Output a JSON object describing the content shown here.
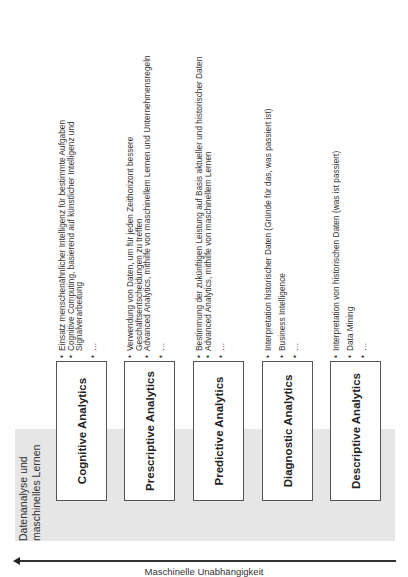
{
  "band": {
    "label_line1": "Datenanalyse und",
    "label_line2": "maschinelles Lernen",
    "color": "#e6e6e6"
  },
  "axis": {
    "label": "Maschinelle Unabhängigkeit",
    "direction": "left"
  },
  "categories": [
    {
      "title": "Cognitive Analytics",
      "bullets": [
        "Einsatz menschenähnlicher Intelligenz für bestimmte Aufgaben",
        "Cognitive Computing, basierend auf künstlicher Intelligenz und",
        "Signalverarbeitung",
        "…"
      ]
    },
    {
      "title": "Prescriptive Analytics",
      "bullets": [
        "Verwendung von Daten, um für jeden Zeithorizont bessere",
        "Geschäftsentscheidungen zu treffen",
        "Advanced Analytics, mithilfe von maschinellem Lernen und Unternehmensregeln",
        "…"
      ]
    },
    {
      "title": "Predictive Analytics",
      "bullets": [
        "Bestimmung der zukünftigen Leistung auf Basis aktueller und historischer Daten",
        "Advanced Analytics, mithilfe von maschinellem Lernen",
        "…"
      ]
    },
    {
      "title": "Diagnostic Analytics",
      "bullets": [
        "Interpretation historischer Daten (Gründe für das, was passiert ist)",
        "Business Intelligence",
        "…"
      ]
    },
    {
      "title": "Descriptive Analytics",
      "bullets": [
        "Interpretation von historischen Daten (was ist passiert)",
        "Data Mining",
        "…"
      ]
    }
  ]
}
